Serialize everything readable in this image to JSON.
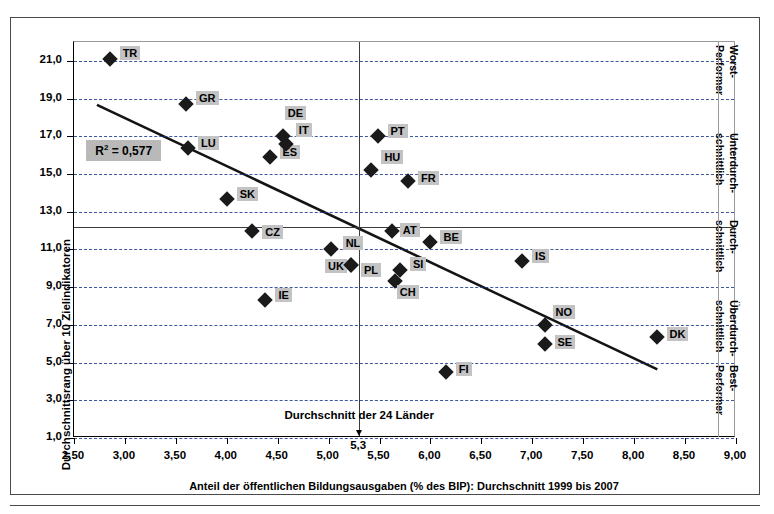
{
  "chart_data": {
    "type": "scatter",
    "title": "",
    "xlabel": "Anteil der öffentlichen Bildungsausgaben (% des BIP): Durchschnitt 1999 bis 2007",
    "ylabel": "Durchschnittsrang über 10 Zielindikatoren",
    "xlim": [
      2.5,
      9.0
    ],
    "ylim": [
      1.0,
      22.0
    ],
    "xticks": [
      "2,50",
      "3,00",
      "3,50",
      "4,00",
      "4,50",
      "5,00",
      "5,50",
      "6,00",
      "6,50",
      "7,00",
      "7,50",
      "8,00",
      "8,50",
      "9,00"
    ],
    "xtick_values": [
      2.5,
      3.0,
      3.5,
      4.0,
      4.5,
      5.0,
      5.5,
      6.0,
      6.5,
      7.0,
      7.5,
      8.0,
      8.5,
      9.0
    ],
    "yticks": [
      "1,0",
      "3,0",
      "5,0",
      "7,0",
      "9,0",
      "11,0",
      "13,0",
      "15,0",
      "17,0",
      "19,0",
      "21,0"
    ],
    "ytick_values": [
      1,
      3,
      5,
      7,
      9,
      11,
      13,
      15,
      17,
      19,
      21
    ],
    "grid": "horizontal-dashed",
    "legend": "none",
    "r_squared_label": "R2 = 0,577",
    "r_squared_value": 0.577,
    "average_line_x": 5.3,
    "average_line_y": 12.2,
    "average_note": "Durchschnitt  der 24 Länder",
    "average_value_label": "5,3",
    "trendline": {
      "x1": 2.72,
      "y1": 18.65,
      "x2": 8.25,
      "y2": 4.55
    },
    "points": [
      {
        "label": "TR",
        "x": 2.85,
        "y": 21.1,
        "lx": 10,
        "ly": -7
      },
      {
        "label": "GR",
        "x": 3.6,
        "y": 18.7,
        "lx": 10,
        "ly": -7
      },
      {
        "label": "LU",
        "x": 3.62,
        "y": 16.4,
        "lx": 10,
        "ly": -6
      },
      {
        "label": "SK",
        "x": 4.0,
        "y": 13.7,
        "lx": 10,
        "ly": -6
      },
      {
        "label": "CZ",
        "x": 4.25,
        "y": 12.0,
        "lx": 10,
        "ly": 0
      },
      {
        "label": "ES",
        "x": 4.42,
        "y": 15.9,
        "lx": 10,
        "ly": -6
      },
      {
        "label": "IE",
        "x": 4.38,
        "y": 8.3,
        "lx": 10,
        "ly": -6
      },
      {
        "label": "DE",
        "x": 4.55,
        "y": 17.0,
        "lx": 2,
        "ly": -24
      },
      {
        "label": "IT",
        "x": 4.58,
        "y": 16.6,
        "lx": 10,
        "ly": -15
      },
      {
        "label": "NL",
        "x": 5.02,
        "y": 11.0,
        "lx": 12,
        "ly": -7
      },
      {
        "label": "UK",
        "x": 5.22,
        "y": 10.2,
        "lx": -26,
        "ly": 0
      },
      {
        "label": "PL",
        "x": 5.22,
        "y": 10.2,
        "lx": 10,
        "ly": 4
      },
      {
        "label": "HU",
        "x": 5.42,
        "y": 15.2,
        "lx": 10,
        "ly": -14
      },
      {
        "label": "PT",
        "x": 5.48,
        "y": 17.0,
        "lx": 10,
        "ly": -6
      },
      {
        "label": "AT",
        "x": 5.62,
        "y": 12.0,
        "lx": 8,
        "ly": -2
      },
      {
        "label": "CH",
        "x": 5.65,
        "y": 9.35,
        "lx": 2,
        "ly": 10
      },
      {
        "label": "SI",
        "x": 5.7,
        "y": 9.9,
        "lx": 10,
        "ly": -7
      },
      {
        "label": "FR",
        "x": 5.78,
        "y": 14.65,
        "lx": 10,
        "ly": -4
      },
      {
        "label": "BE",
        "x": 6.0,
        "y": 11.4,
        "lx": 10,
        "ly": -6
      },
      {
        "label": "FI",
        "x": 6.15,
        "y": 4.5,
        "lx": 10,
        "ly": -4
      },
      {
        "label": "IS",
        "x": 6.9,
        "y": 10.4,
        "lx": 10,
        "ly": -6
      },
      {
        "label": "NO",
        "x": 7.12,
        "y": 7.0,
        "lx": 8,
        "ly": -14
      },
      {
        "label": "SE",
        "x": 7.12,
        "y": 6.0,
        "lx": 10,
        "ly": -3
      },
      {
        "label": "DK",
        "x": 8.22,
        "y": 6.35,
        "lx": 10,
        "ly": -4
      }
    ],
    "right_bands": [
      {
        "line1": "Worst-",
        "line2": "Performer"
      },
      {
        "line1": "Unterdurch-",
        "line2": "schnittlich"
      },
      {
        "line1": "Durch-",
        "line2": "schnittlich"
      },
      {
        "line1": "Überdurch-",
        "line2": "schnittlich"
      },
      {
        "line1": "Best-",
        "line2": "Performer"
      }
    ]
  }
}
